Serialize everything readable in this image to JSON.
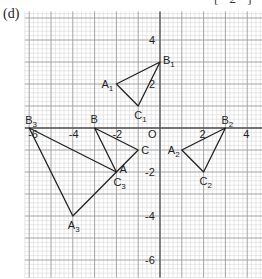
{
  "part_label": "(d)",
  "marks_label": "[ 2 ]",
  "grid": {
    "x_min": -6.2,
    "x_max": 4.7,
    "y_min": -6.8,
    "y_max": 5.3,
    "minor_step": 0.2,
    "major_step": 1,
    "colors": {
      "minor": "#d0d0d0",
      "major": "#9a9a9a",
      "axis": "#555555",
      "shape": "#222222"
    }
  },
  "axes": {
    "origin_label": "O",
    "x_ticks": [
      {
        "value": -6,
        "label": "-6"
      },
      {
        "value": -4,
        "label": "-4"
      },
      {
        "value": -2,
        "label": "-2"
      },
      {
        "value": 2,
        "label": "2"
      },
      {
        "value": 4,
        "label": "4"
      }
    ],
    "y_ticks": [
      {
        "value": 4,
        "label": "4"
      },
      {
        "value": 2,
        "label": "2"
      },
      {
        "value": -2,
        "label": "-2"
      },
      {
        "value": -4,
        "label": "-4"
      },
      {
        "value": -6,
        "label": "-6"
      }
    ]
  },
  "triangles": [
    {
      "name": "ABC",
      "vertices": [
        {
          "label": "A",
          "x": -2,
          "y": -2
        },
        {
          "label": "B",
          "x": -3,
          "y": 0
        },
        {
          "label": "C",
          "x": -1,
          "y": -1
        }
      ]
    },
    {
      "name": "A1B1C1",
      "vertices": [
        {
          "label": "A1",
          "x": -2,
          "y": 2
        },
        {
          "label": "B1",
          "x": 0,
          "y": 3
        },
        {
          "label": "C1",
          "x": -1,
          "y": 1
        }
      ]
    },
    {
      "name": "A2B2C2",
      "vertices": [
        {
          "label": "A2",
          "x": 1,
          "y": -1
        },
        {
          "label": "B2",
          "x": 3,
          "y": 0
        },
        {
          "label": "C2",
          "x": 2,
          "y": -2
        }
      ]
    },
    {
      "name": "A3B3C3",
      "vertices": [
        {
          "label": "A3",
          "x": -4,
          "y": -4
        },
        {
          "label": "B3",
          "x": -6,
          "y": 0
        },
        {
          "label": "C3",
          "x": -2,
          "y": -2
        }
      ]
    }
  ],
  "vertex_labels": [
    {
      "text": "A",
      "sub": "",
      "x": -2,
      "y": -2,
      "dx": 3,
      "dy": 1
    },
    {
      "text": "B",
      "sub": "",
      "x": -3,
      "y": 0,
      "dx": -4,
      "dy": -5
    },
    {
      "text": "C",
      "sub": "",
      "x": -1,
      "y": -1,
      "dx": 3,
      "dy": 4
    },
    {
      "text": "A",
      "sub": "1",
      "x": -2,
      "y": 2,
      "dx": -15,
      "dy": 4
    },
    {
      "text": "B",
      "sub": "1",
      "x": 0,
      "y": 3,
      "dx": 3,
      "dy": 2
    },
    {
      "text": "C",
      "sub": "1",
      "x": -1,
      "y": 1,
      "dx": -4,
      "dy": 13
    },
    {
      "text": "A",
      "sub": "2",
      "x": 1,
      "y": -1,
      "dx": -14,
      "dy": 4
    },
    {
      "text": "B",
      "sub": "2",
      "x": 3,
      "y": 0,
      "dx": -4,
      "dy": -4
    },
    {
      "text": "C",
      "sub": "2",
      "x": 2,
      "y": -2,
      "dx": -4,
      "dy": 13
    },
    {
      "text": "A",
      "sub": "3",
      "x": -4,
      "y": -4,
      "dx": -5,
      "dy": 13
    },
    {
      "text": "B",
      "sub": "3",
      "x": -6,
      "y": 0,
      "dx": -4,
      "dy": -4
    },
    {
      "text": "C",
      "sub": "3",
      "x": -2,
      "y": -2,
      "dx": -3,
      "dy": 14
    }
  ]
}
